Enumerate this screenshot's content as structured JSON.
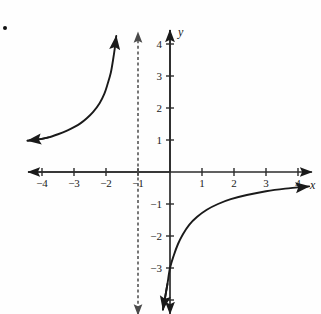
{
  "figure": {
    "kind": "coordinate-plane-graph",
    "bullet_marker": "•",
    "axis_labels": {
      "x": "x",
      "y": "y"
    },
    "colors": {
      "axis": "#2b2b2b",
      "curve": "#1a1a1a",
      "asymptote": "#4a4a4a",
      "text": "#1a1a1a",
      "background": "#fefefe"
    }
  },
  "chart_data": {
    "type": "line",
    "title": "",
    "xlabel": "x",
    "ylabel": "y",
    "grid": false,
    "legend": null,
    "xlim": [
      -4.5,
      4.5
    ],
    "ylim": [
      -4.5,
      4.5
    ],
    "xticks": [
      -4,
      -3,
      -2,
      -1,
      1,
      2,
      3,
      4
    ],
    "xtick_labels": [
      "−4",
      "−3",
      "−2",
      "−1",
      "1",
      "2",
      "3",
      "4"
    ],
    "yticks": [
      4,
      3,
      2,
      1,
      -1,
      -2,
      -3,
      -4
    ],
    "ytick_labels": [
      "4",
      "3",
      "2",
      "1",
      "−1",
      "−2",
      "−3",
      ""
    ],
    "annotations": [
      {
        "name": "vertical-asymptote",
        "style": "dashed",
        "x": -1,
        "label": ""
      },
      {
        "name": "horizontal-asymptote",
        "style": "implied",
        "y": 0,
        "label": ""
      },
      {
        "name": "y-intercept",
        "x": 0,
        "y": -3,
        "label": ""
      }
    ],
    "series": [
      {
        "name": "left-branch",
        "style": "solid",
        "arrow_start": true,
        "arrow_end": true,
        "points": [
          [
            -4.45,
            0.98
          ],
          [
            -4.1,
            1.02
          ],
          [
            -3.8,
            1.08
          ],
          [
            -3.5,
            1.18
          ],
          [
            -3.2,
            1.3
          ],
          [
            -3.0,
            1.4
          ],
          [
            -2.8,
            1.52
          ],
          [
            -2.6,
            1.68
          ],
          [
            -2.4,
            1.88
          ],
          [
            -2.2,
            2.15
          ],
          [
            -2.05,
            2.45
          ],
          [
            -1.95,
            2.75
          ],
          [
            -1.85,
            3.1
          ],
          [
            -1.78,
            3.5
          ],
          [
            -1.72,
            3.9
          ],
          [
            -1.68,
            4.25
          ]
        ]
      },
      {
        "name": "right-branch",
        "style": "solid",
        "arrow_start": true,
        "arrow_end": true,
        "points": [
          [
            -0.22,
            -4.3
          ],
          [
            -0.15,
            -3.9
          ],
          [
            -0.08,
            -3.5
          ],
          [
            0.0,
            -3.0
          ],
          [
            0.12,
            -2.6
          ],
          [
            0.25,
            -2.25
          ],
          [
            0.4,
            -1.95
          ],
          [
            0.6,
            -1.65
          ],
          [
            0.85,
            -1.4
          ],
          [
            1.15,
            -1.18
          ],
          [
            1.5,
            -1.0
          ],
          [
            1.9,
            -0.85
          ],
          [
            2.4,
            -0.72
          ],
          [
            3.0,
            -0.6
          ],
          [
            3.6,
            -0.52
          ],
          [
            4.35,
            -0.45
          ]
        ]
      }
    ]
  }
}
